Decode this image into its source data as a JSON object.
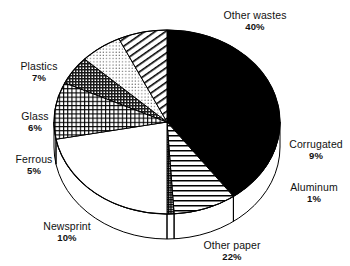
{
  "chart_data": {
    "type": "pie",
    "title": "",
    "subtitle": "",
    "xlabel": "",
    "ylabel": "",
    "legend_position": "none",
    "grid": false,
    "three_d": true,
    "start_angle_deg": 0,
    "direction": "clockwise",
    "categories": [
      "Other wastes",
      "Corrugated",
      "Aluminum",
      "Other paper",
      "Newsprint",
      "Ferrous",
      "Glass",
      "Plastics"
    ],
    "values": [
      40,
      9,
      1,
      22,
      10,
      5,
      6,
      7
    ],
    "unit": "%",
    "slices": [
      {
        "label": "Other wastes",
        "value": 40,
        "percent_text": "40%",
        "fill": "solid-black",
        "color": "#000000"
      },
      {
        "label": "Corrugated",
        "value": 9,
        "percent_text": "9%",
        "fill": "horizontal-lines",
        "color": "#000000"
      },
      {
        "label": "Aluminum",
        "value": 1,
        "percent_text": "1%",
        "fill": "dense-crosshatch",
        "color": "#000000"
      },
      {
        "label": "Other paper",
        "value": 22,
        "percent_text": "22%",
        "fill": "white-blank",
        "color": "#ffffff"
      },
      {
        "label": "Newsprint",
        "value": 10,
        "percent_text": "10%",
        "fill": "grid-crosshatch",
        "color": "#000000"
      },
      {
        "label": "Ferrous",
        "value": 5,
        "percent_text": "5%",
        "fill": "dark-crosshatch",
        "color": "#000000"
      },
      {
        "label": "Glass",
        "value": 6,
        "percent_text": "6%",
        "fill": "fine-dots",
        "color": "#000000"
      },
      {
        "label": "Plastics",
        "value": 7,
        "percent_text": "7%",
        "fill": "diagonal-hatch",
        "color": "#000000"
      }
    ],
    "total": 100
  },
  "labels": {
    "other_wastes": {
      "name": "Other wastes",
      "pct": "40%"
    },
    "corrugated": {
      "name": "Corrugated",
      "pct": "9%"
    },
    "aluminum": {
      "name": "Aluminum",
      "pct": "1%"
    },
    "other_paper": {
      "name": "Other paper",
      "pct": "22%"
    },
    "newsprint": {
      "name": "Newsprint",
      "pct": "10%"
    },
    "ferrous": {
      "name": "Ferrous",
      "pct": "5%"
    },
    "glass": {
      "name": "Glass",
      "pct": "6%"
    },
    "plastics": {
      "name": "Plastics",
      "pct": "7%"
    }
  },
  "colors": {
    "outline": "#000000",
    "background": "#ffffff",
    "text": "#111111"
  }
}
